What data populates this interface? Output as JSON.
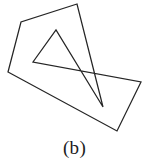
{
  "figure": {
    "caption": "(b)",
    "kind": "line-drawing",
    "canvas": {
      "width": 149,
      "height": 163,
      "drawing_width": 149,
      "drawing_height": 138,
      "background_color": "#ffffff"
    },
    "style": {
      "stroke_color": "#252525",
      "stroke_width": 1.25,
      "fill": "none"
    },
    "shapes": [
      {
        "name": "self-intersecting-polygon",
        "closed": true,
        "vertices": [
          [
            77,
            4
          ],
          [
            21,
            22
          ],
          [
            8,
            72
          ],
          [
            117,
            131
          ],
          [
            141,
            82
          ],
          [
            33,
            62
          ],
          [
            56,
            30
          ],
          [
            103,
            107
          ]
        ],
        "path": "M 77 4 L 21 22 L 8 72 L 117 131 L 141 82 L 33 62 L 56 30 L 103 107 Z"
      }
    ]
  }
}
